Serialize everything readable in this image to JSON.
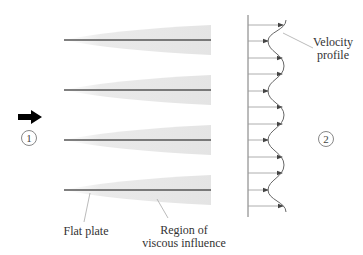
{
  "diagram": {
    "type": "flow-over-parallel-flat-plates",
    "labels": {
      "velocity_profile_line1": "Velocity",
      "velocity_profile_line2": "profile",
      "flat_plate": "Flat plate",
      "region_line1": "Region of",
      "region_line2": "viscous influence"
    },
    "stations": {
      "inlet": "1",
      "outlet": "2"
    },
    "plates": [
      {
        "y": 40,
        "x_start": 64,
        "x_end": 211
      },
      {
        "y": 90,
        "x_start": 64,
        "x_end": 211
      },
      {
        "y": 140,
        "x_start": 64,
        "x_end": 211
      },
      {
        "y": 190,
        "x_start": 64,
        "x_end": 211
      }
    ],
    "velocity_arrows": [
      {
        "y": 25,
        "tip_x": 283
      },
      {
        "y": 41,
        "tip_x": 268
      },
      {
        "y": 58,
        "tip_x": 282
      },
      {
        "y": 74,
        "tip_x": 282
      },
      {
        "y": 91,
        "tip_x": 268
      },
      {
        "y": 107,
        "tip_x": 282
      },
      {
        "y": 124,
        "tip_x": 282
      },
      {
        "y": 140,
        "tip_x": 268
      },
      {
        "y": 157,
        "tip_x": 282
      },
      {
        "y": 173,
        "tip_x": 282
      },
      {
        "y": 190,
        "tip_x": 268
      },
      {
        "y": 206,
        "tip_x": 283
      }
    ],
    "colors": {
      "plate": "#555555",
      "viscous_region": "#e6e6e6",
      "arrow": "#999999",
      "arrowhead": "#444444",
      "profile_curve": "#666666",
      "wall": "#777777",
      "flow_arrow": "#000000"
    }
  }
}
